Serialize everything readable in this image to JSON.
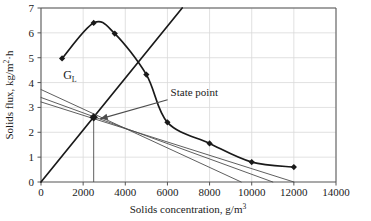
{
  "chart_data": {
    "type": "line",
    "title": "",
    "subtitle": "",
    "xlabel": "Solids concentration, g/m3",
    "xlabel_main": "Solids concentration, g/m",
    "xlabel_exp": "3",
    "ylabel": "Solids flux, kg/m2.h",
    "ylabel_main_a": "Solids flux, kg/m",
    "ylabel_exp": "2",
    "ylabel_main_b": "·h",
    "xlim": [
      0,
      14000
    ],
    "ylim": [
      0,
      7
    ],
    "xticks": [
      0,
      2000,
      4000,
      6000,
      8000,
      10000,
      12000,
      14000
    ],
    "xtick_labels": [
      "0",
      "2000",
      "4000",
      "6000",
      "8000",
      "10000",
      "12000",
      "14000"
    ],
    "yticks": [
      0,
      1,
      2,
      3,
      4,
      5,
      6,
      7
    ],
    "ytick_labels": [
      "0",
      "1",
      "2",
      "3",
      "4",
      "5",
      "6",
      "7"
    ],
    "grid": true,
    "grid_color": "#d9d9d9",
    "axis_color": "#555555",
    "series_color": "#1a1a1a",
    "line_color": "#4d4d4d",
    "legend_position": "none",
    "series": [
      {
        "name": "Gravity settling flux curve",
        "type": "line",
        "marker": "diamond",
        "x": [
          1000,
          2500,
          3500,
          5000,
          6000,
          8000,
          10000,
          12000
        ],
        "values": [
          4.97,
          6.4,
          5.97,
          4.32,
          2.4,
          1.55,
          0.8,
          0.6
        ]
      },
      {
        "name": "Underflow transport (operating) line",
        "type": "line",
        "marker": "none",
        "x": [
          0,
          6700
        ],
        "values": [
          0,
          7.0
        ]
      },
      {
        "name": "Overflow limiting flux line GL 1",
        "type": "line",
        "marker": "none",
        "x": [
          0,
          9500
        ],
        "values": [
          3.72,
          0
        ]
      },
      {
        "name": "Overflow limiting flux line GL 2",
        "type": "line",
        "marker": "none",
        "x": [
          0,
          11000
        ],
        "values": [
          3.4,
          0
        ]
      },
      {
        "name": "Overflow limiting flux line GL 3",
        "type": "line",
        "marker": "none",
        "x": [
          0,
          12000
        ],
        "values": [
          3.22,
          0
        ]
      }
    ],
    "annotations": [
      {
        "name": "gl-label",
        "text": "G",
        "subscript": "L",
        "x": 1050,
        "y": 4.15
      },
      {
        "name": "state-point-label",
        "text": "State point",
        "x": 6150,
        "y": 3.35,
        "arrow_to_x": 2500,
        "arrow_to_y": 2.6
      }
    ],
    "state_point": {
      "x": 2500,
      "y": 2.6,
      "dropline_to_y": 0
    }
  }
}
